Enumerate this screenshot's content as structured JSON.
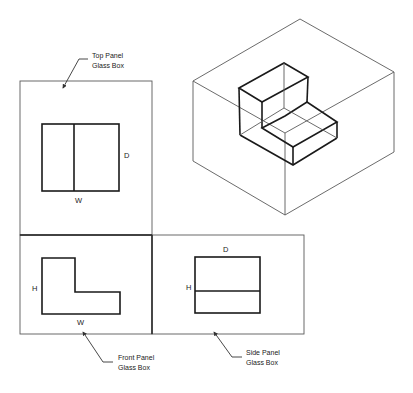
{
  "diagram": {
    "type": "orthographic-projection-glass-box",
    "callouts": {
      "top": {
        "line1": "Top Panel",
        "line2": "Glass Box"
      },
      "front": {
        "line1": "Front Panel",
        "line2": "Glass Box"
      },
      "side": {
        "line1": "Side Panel",
        "line2": "Glass Box"
      }
    },
    "views": {
      "top": {
        "width_label": "W",
        "depth_label": "D"
      },
      "front": {
        "height_label": "H",
        "width_label": "W"
      },
      "side": {
        "depth_label": "D",
        "height_label": "H"
      }
    },
    "colors": {
      "outline": "#1a1a1a",
      "panel": "#5a5a5a",
      "background": "#ffffff"
    }
  }
}
